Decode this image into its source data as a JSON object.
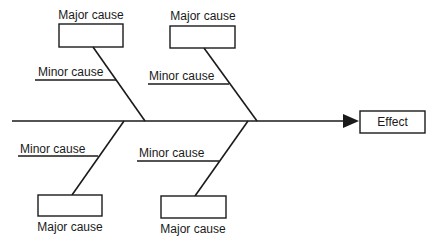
{
  "diagram": {
    "type": "fishbone",
    "effect": {
      "label": "Effect"
    },
    "causes": [
      {
        "position": "top-left",
        "major_label": "Major cause",
        "minor_label": "Minor cause"
      },
      {
        "position": "top-right",
        "major_label": "Major cause",
        "minor_label": "Minor cause"
      },
      {
        "position": "bottom-left",
        "major_label": "Major cause",
        "minor_label": "Minor cause"
      },
      {
        "position": "bottom-right",
        "major_label": "Major cause",
        "minor_label": "Minor cause"
      }
    ],
    "colors": {
      "stroke": "#1a1a1a",
      "background": "#ffffff"
    }
  }
}
